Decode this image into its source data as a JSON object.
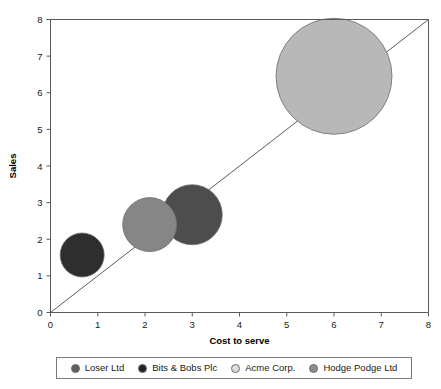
{
  "chart_data": {
    "type": "scatter",
    "title": "",
    "xlabel": "Cost to serve",
    "ylabel": "Sales",
    "xlim": [
      0,
      8
    ],
    "ylim": [
      0,
      8
    ],
    "xticks": [
      "0",
      "1",
      "2",
      "3",
      "4",
      "5",
      "6",
      "7",
      "8"
    ],
    "yticks": [
      "0",
      "1",
      "2",
      "3",
      "4",
      "5",
      "6",
      "7",
      "8"
    ],
    "grid": false,
    "legend_position": "bottom",
    "reference_line": {
      "from": [
        0,
        0
      ],
      "to": [
        8,
        8
      ],
      "color": "#4a4a4a"
    },
    "bubbles": [
      {
        "name": "Loser Ltd",
        "x": 0.67,
        "y": 1.57,
        "r_px": 22,
        "color": "#2e2e2e"
      },
      {
        "name": "Bits & Bobs Plc",
        "x": 3.0,
        "y": 2.67,
        "r_px": 30,
        "color": "#4d4d4d"
      },
      {
        "name": "Acme Corp.",
        "x": 6.0,
        "y": 6.45,
        "r_px": 58,
        "color": "#b8b8b8"
      },
      {
        "name": "Hodge Podge Ltd",
        "x": 2.1,
        "y": 2.4,
        "r_px": 27,
        "color": "#868686"
      }
    ],
    "series": [
      {
        "name": "Loser Ltd",
        "values": [
          0.67,
          1.57
        ]
      },
      {
        "name": "Bits & Bobs Plc",
        "values": [
          3.0,
          2.67
        ]
      },
      {
        "name": "Acme Corp.",
        "values": [
          6.0,
          6.45
        ]
      },
      {
        "name": "Hodge Podge Ltd",
        "values": [
          2.1,
          2.4
        ]
      }
    ]
  },
  "axes": {
    "x_title": "Cost to serve",
    "y_title": "Sales",
    "x_ticks": [
      "0",
      "1",
      "2",
      "3",
      "4",
      "5",
      "6",
      "7",
      "8"
    ],
    "y_ticks": [
      "0",
      "1",
      "2",
      "3",
      "4",
      "5",
      "6",
      "7",
      "8"
    ]
  },
  "legend": {
    "items": [
      {
        "label": "Loser Ltd",
        "color": "#5e5e5e"
      },
      {
        "label": "Bits & Bobs Plc",
        "color": "#222222"
      },
      {
        "label": "Acme Corp.",
        "color": "#dcdcdc"
      },
      {
        "label": "Hodge Podge Ltd",
        "color": "#8c8c8c"
      }
    ]
  }
}
